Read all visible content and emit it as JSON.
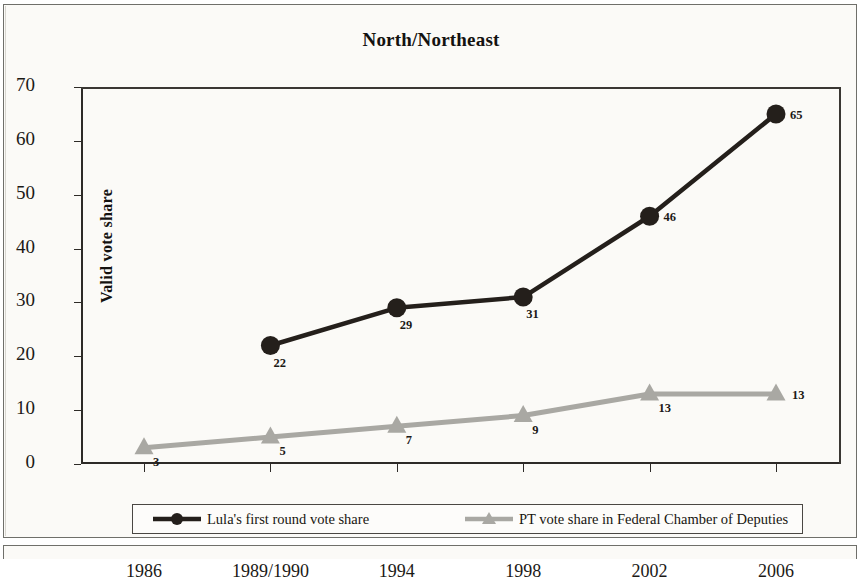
{
  "chart_data": {
    "type": "line",
    "title": "North/Northeast",
    "xlabel": "",
    "ylabel": "Valid vote share",
    "categories": [
      "1986",
      "1989/1990",
      "1994",
      "1998",
      "2002",
      "2006"
    ],
    "ylim": [
      0,
      70
    ],
    "yticks": [
      0,
      10,
      20,
      30,
      40,
      50,
      60,
      70
    ],
    "grid": false,
    "legend_position": "bottom",
    "series": [
      {
        "name": "Lula's first round vote share",
        "color": "#241f1b",
        "marker": "circle",
        "values": [
          null,
          22,
          29,
          31,
          46,
          65
        ],
        "labels": [
          "",
          "22",
          "29",
          "31",
          "46",
          "65"
        ]
      },
      {
        "name": "PT vote share in Federal Chamber of Deputies",
        "color": "#a9a8a3",
        "marker": "triangle",
        "values": [
          3,
          5,
          7,
          9,
          13,
          13
        ],
        "labels": [
          "3",
          "5",
          "7",
          "9",
          "13",
          "13"
        ]
      }
    ]
  },
  "legend": {
    "entries": [
      {
        "label": "Lula's first round vote share"
      },
      {
        "label": "PT vote share in Federal Chamber of Deputies"
      }
    ]
  }
}
